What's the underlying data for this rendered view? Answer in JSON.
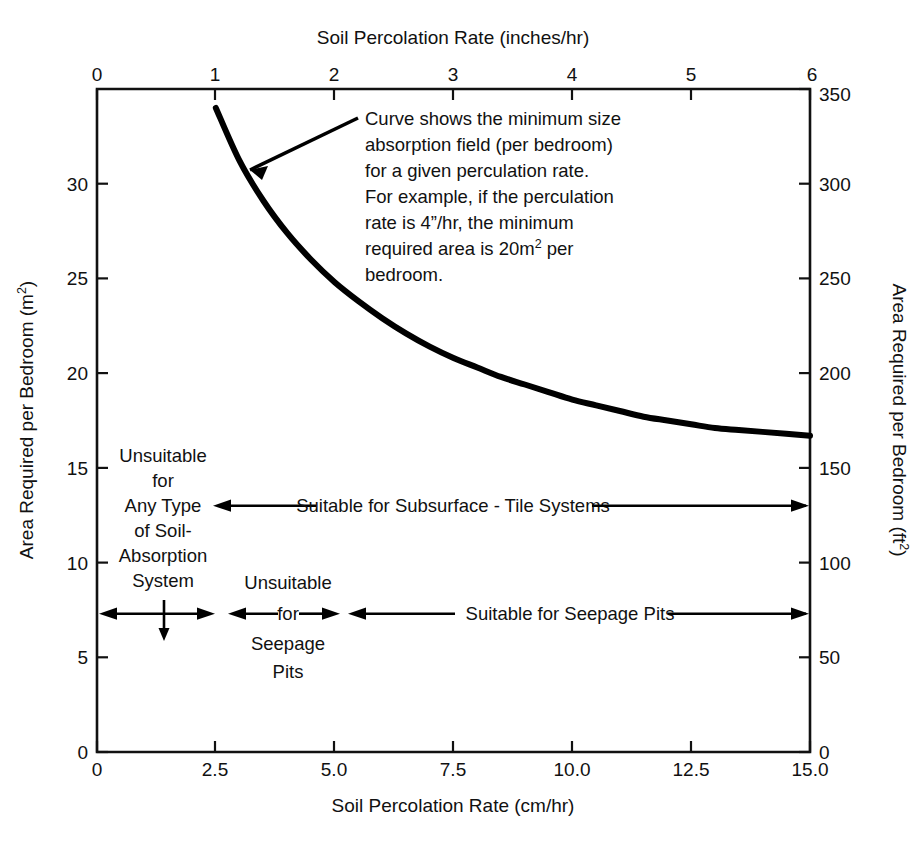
{
  "chart_data": {
    "type": "line",
    "title": "",
    "axes": {
      "top": {
        "label": "Soil Percolation Rate (inches/hr)",
        "ticks": [
          "0",
          "1",
          "2",
          "3",
          "4",
          "5",
          "6"
        ],
        "values": [
          0,
          1,
          2,
          3,
          4,
          5,
          6
        ],
        "range": [
          0,
          6
        ],
        "unit": "inches/hr"
      },
      "bottom": {
        "label": "Soil Percolation Rate (cm/hr)",
        "ticks": [
          "0",
          "2.5",
          "5.0",
          "7.5",
          "10.0",
          "12.5",
          "15.0"
        ],
        "values": [
          0,
          2.5,
          5.0,
          7.5,
          10.0,
          12.5,
          15.0
        ],
        "range": [
          0,
          15
        ],
        "unit": "cm/hr"
      },
      "left": {
        "label_pre": "Area Required per Bedroom (m",
        "label_sup": "2",
        "label_post": ")",
        "label": "Area Required per Bedroom (m2)",
        "ticks": [
          "0",
          "5",
          "10",
          "15",
          "20",
          "25",
          "30"
        ],
        "values": [
          0,
          5,
          10,
          15,
          20,
          25,
          30
        ],
        "range": [
          0,
          35
        ],
        "unit": "m2"
      },
      "right": {
        "label_pre": "Area Required per Bedroom (ft",
        "label_sup": "2",
        "label_post": ")",
        "label": "Area Required per Bedroom (ft2)",
        "ticks": [
          "0",
          "50",
          "100",
          "150",
          "200",
          "250",
          "300",
          "350"
        ],
        "values": [
          0,
          50,
          100,
          150,
          200,
          250,
          300,
          350
        ],
        "range": [
          0,
          350
        ],
        "unit": "ft2"
      }
    },
    "grid": false,
    "legend": null,
    "series": [
      {
        "name": "Minimum absorption field area per bedroom",
        "x_unit": "cm/hr",
        "y_unit": "m2",
        "x": [
          2.5,
          3.0,
          3.5,
          4.0,
          4.5,
          5.0,
          5.5,
          6.0,
          6.5,
          7.0,
          7.5,
          8.0,
          8.5,
          9.0,
          9.5,
          10.0,
          10.5,
          11.0,
          11.5,
          12.0,
          12.5,
          13.0,
          13.5,
          14.0,
          14.5,
          15.0
        ],
        "y": [
          34.0,
          31.2,
          29.1,
          27.4,
          26.0,
          24.8,
          23.8,
          22.9,
          22.1,
          21.4,
          20.8,
          20.3,
          19.8,
          19.4,
          19.0,
          18.6,
          18.3,
          18.0,
          17.7,
          17.5,
          17.3,
          17.1,
          17.0,
          16.9,
          16.8,
          16.7
        ]
      }
    ],
    "annotations": [
      {
        "name": "curve-callout",
        "lines": [
          "Curve shows the minimum size",
          "absorption field (per bedroom)",
          "for a given perculation rate.",
          "For example, if the perculation",
          "rate is 4”/hr, the minimum",
          "required area is 20m² per",
          "bedroom."
        ]
      },
      {
        "name": "unsuitable-any-type-block",
        "lines": [
          "Unsuitable",
          "for",
          "Any Type",
          "of Soil-",
          "Absorption",
          "System"
        ]
      },
      {
        "name": "unsuitable-seepage-block",
        "lines": [
          "Unsuitable",
          "for",
          "Seepage",
          "Pits"
        ]
      },
      {
        "name": "suitable-subsurface-band",
        "text": "Suitable for Subsurface - Tile Systems",
        "y_m2": 13.0,
        "x_from_cm_hr": 2.5,
        "x_to_cm_hr": 15.0
      },
      {
        "name": "suitable-seepage-band",
        "text": "Suitable for Seepage Pits",
        "y_m2": 7.3,
        "x_from_cm_hr": 5.0,
        "x_to_cm_hr": 15.0
      }
    ]
  },
  "callout": {
    "l1": "Curve shows the minimum size",
    "l2": "absorption field (per bedroom)",
    "l3": "for a given perculation rate.",
    "l4": "For example, if the perculation",
    "l5_a": "rate is 4”/hr, the minimum",
    "l6_a": "required area is 20m",
    "l6_sup": "2",
    "l6_b": " per",
    "l7": "bedroom."
  },
  "bands": {
    "unsuitable_any": {
      "l1": "Unsuitable",
      "l2": "for",
      "l3": "Any Type",
      "l4": "of Soil-",
      "l5": "Absorption",
      "l6": "System"
    },
    "unsuitable_seepage": {
      "l1": "Unsuitable",
      "l2": "for",
      "l3": "Seepage",
      "l4": "Pits"
    },
    "suitable_subsurface": "Suitable for Subsurface - Tile Systems",
    "suitable_seepage": "Suitable for Seepage Pits"
  },
  "ticks": {
    "top": [
      "0",
      "1",
      "2",
      "3",
      "4",
      "5",
      "6"
    ],
    "bottom": [
      "0",
      "2.5",
      "5.0",
      "7.5",
      "10.0",
      "12.5",
      "15.0"
    ],
    "left": [
      "0",
      "5",
      "10",
      "15",
      "20",
      "25",
      "30"
    ],
    "right": [
      "0",
      "50",
      "100",
      "150",
      "200",
      "250",
      "300",
      "350"
    ]
  },
  "colors": {
    "ink": "#111111",
    "background": "#ffffff",
    "curve": "#000000"
  }
}
